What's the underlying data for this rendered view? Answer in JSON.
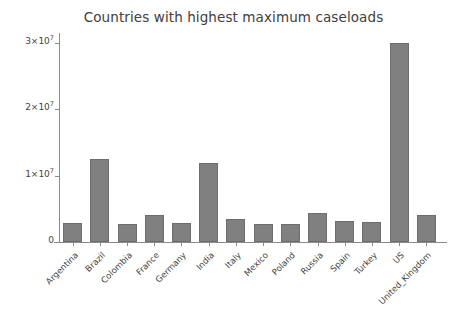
{
  "chart_data": {
    "type": "bar",
    "title": "Countries with highest maximum caseloads",
    "xlabel": "",
    "ylabel": "",
    "ylim": [
      0,
      31500000
    ],
    "grid": false,
    "legend": null,
    "y_tick_values": [
      0,
      10000000,
      20000000,
      30000000
    ],
    "y_tick_labels": [
      "0",
      "1×10⁷",
      "2×10⁷",
      "3×10⁷"
    ],
    "y_tick_mantissas": [
      "0",
      "1×10",
      "2×10",
      "3×10"
    ],
    "y_tick_exponents": [
      "",
      "7",
      "7",
      "7"
    ],
    "categories": [
      "Argentina",
      "Brazil",
      "Colombia",
      "France",
      "Germany",
      "India",
      "Italy",
      "Mexico",
      "Poland",
      "Russia",
      "Spain",
      "Turkey",
      "US",
      "United_Kingdom"
    ],
    "values": [
      2800000,
      12500000,
      2700000,
      4000000,
      2900000,
      11900000,
      3400000,
      2700000,
      2700000,
      4300000,
      3100000,
      3000000,
      30000000,
      4000000
    ],
    "series": [
      {
        "name": "maximum caseload",
        "values": [
          2800000,
          12500000,
          2700000,
          4000000,
          2900000,
          11900000,
          3400000,
          2700000,
          2700000,
          4300000,
          3100000,
          3000000,
          30000000,
          4000000
        ]
      }
    ],
    "colors": {
      "bar_fill": "#808080",
      "bar_edge": "#6e6e6e",
      "axis": "#8a8a8a",
      "text": "#3f3f3f",
      "title": "#404040",
      "background": "#ffffff"
    }
  }
}
